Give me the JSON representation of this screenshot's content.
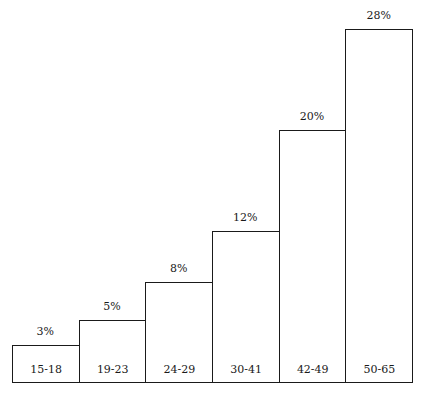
{
  "chart_data": {
    "type": "bar",
    "title": "",
    "xlabel": "",
    "ylabel": "",
    "categories": [
      "15-18",
      "19-23",
      "24-29",
      "30-41",
      "42-49",
      "50-65"
    ],
    "values": [
      3,
      5,
      8,
      12,
      20,
      28
    ],
    "value_labels": [
      "3%",
      "5%",
      "8%",
      "12%",
      "20%",
      "28%"
    ],
    "unit": "%",
    "ylim": [
      0,
      30
    ],
    "grid": false,
    "legend": null,
    "category_label_position": "inside-bottom",
    "value_label_position": "above-bar"
  },
  "bars": [
    {
      "category": "15-18",
      "label": "3%"
    },
    {
      "category": "19-23",
      "label": "5%"
    },
    {
      "category": "24-29",
      "label": "8%"
    },
    {
      "category": "30-41",
      "label": "12%"
    },
    {
      "category": "42-49",
      "label": "20%"
    },
    {
      "category": "50-65",
      "label": "28%"
    }
  ]
}
